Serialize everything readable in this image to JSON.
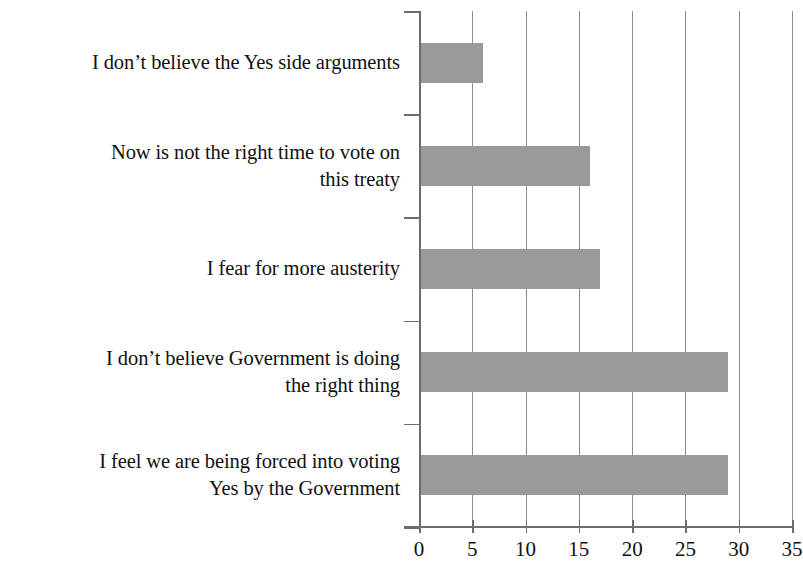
{
  "chart_data": {
    "type": "bar",
    "orientation": "horizontal",
    "title": "",
    "subtitle": "",
    "xlabel": "",
    "ylabel": "",
    "categories": [
      "I don’t believe the Yes side arguments",
      "Now is not the right time to vote on this treaty",
      "I fear for more austerity",
      "I don’t believe Government is doing the right thing",
      "I feel we are being forced into voting Yes by the Government"
    ],
    "values": [
      6,
      16,
      17,
      29,
      29
    ],
    "xlim": [
      0,
      35
    ],
    "xticks": [
      0,
      5,
      10,
      15,
      20,
      25,
      30,
      35
    ],
    "xtick_labels": [
      "0",
      "5",
      "10",
      "15",
      "20",
      "25",
      "30",
      "35"
    ],
    "grid": "vertical",
    "legend": "none",
    "bar_color": "#9a9a9a",
    "axis_color": "#6d6d6d",
    "grid_color": "#8d8d8d",
    "background_color": "#ffffff"
  },
  "labels": {
    "lines": [
      [
        "I don’t believe the Yes side arguments"
      ],
      [
        "Now is not the right time to vote on",
        "this treaty"
      ],
      [
        "I fear for more austerity"
      ],
      [
        "I don’t believe Government is doing",
        "the right thing"
      ],
      [
        "I feel we are being forced into voting",
        "Yes by the Government"
      ]
    ]
  }
}
